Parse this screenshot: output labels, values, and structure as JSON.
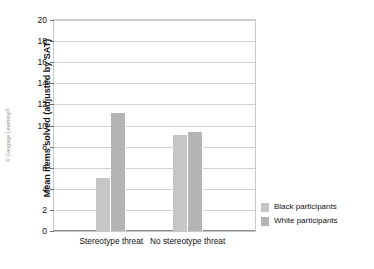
{
  "credit": "© Cengage Learning®",
  "chart_data": {
    "type": "bar",
    "title": "",
    "xlabel": "",
    "ylabel": "Mean items solved (adjusted by SAT)",
    "categories": [
      "Stereotype threat",
      "No stereotype threat"
    ],
    "series": [
      {
        "name": "Black participants",
        "values": [
          5.0,
          9.1
        ],
        "color": "#c6c6c6"
      },
      {
        "name": "White participants",
        "values": [
          11.2,
          9.4
        ],
        "color": "#b4b4b4"
      }
    ],
    "ylim": [
      0,
      20
    ],
    "ytick_step": 2,
    "yticks": [
      "20",
      "18",
      "16",
      "14",
      "12",
      "10",
      "8",
      "6",
      "4",
      "2",
      "0"
    ],
    "ytick_values": [
      20,
      18,
      16,
      14,
      12,
      10,
      8,
      6,
      4,
      2,
      0
    ],
    "grid": true,
    "legend_position": "right",
    "legend": [
      {
        "label": "Black participants",
        "color": "#c6c6c6"
      },
      {
        "label": "White participants",
        "color": "#b4b4b4"
      }
    ]
  }
}
